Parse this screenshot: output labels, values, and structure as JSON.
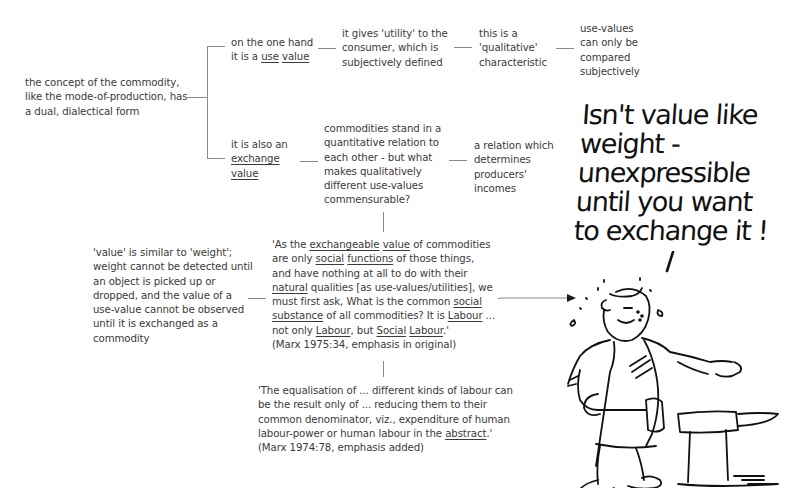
{
  "diagram": {
    "root": {
      "text": "the concept of the commodity, like the mode-of-production, has a dual, dialectical form"
    },
    "use_value_branch": {
      "label_prefix": "on the one hand it is a ",
      "label_u1": "use",
      "label_u2": "value",
      "utility": "it gives 'utility' to the consumer, which is subjectively defined",
      "qualitative": "this is a 'qualitative' characteristic",
      "compared": "use-values can only be compared subjectively"
    },
    "exchange_value_branch": {
      "label_prefix": "it is also an",
      "label_u1": "exchange",
      "label_u2": "value",
      "quantitative": "commodities stand in a quantitative relation to each other - but what makes qualitatively different use-values commensurable?",
      "incomes": "a relation which determines producers' incomes"
    },
    "weight_note": "'value' is similar to 'weight'; weight cannot be detected until an object is picked up or dropped, and the value of a use-value cannot be observed until it is exchanged as a commodity",
    "quote1": {
      "parts": [
        {
          "t": "'As the ",
          "s": ""
        },
        {
          "t": "exchangeable",
          "s": "u"
        },
        {
          "t": " ",
          "s": ""
        },
        {
          "t": "value",
          "s": "u"
        },
        {
          "t": " of commodities are only ",
          "s": ""
        },
        {
          "t": "social",
          "s": "u"
        },
        {
          "t": " ",
          "s": ""
        },
        {
          "t": "functions",
          "s": "u"
        },
        {
          "t": " of those things, and have nothing at all to do with their ",
          "s": ""
        },
        {
          "t": "natural",
          "s": "u"
        },
        {
          "t": " qualities [as use-values/utilities], we must first ask, What is the common ",
          "s": ""
        },
        {
          "t": "social",
          "s": "u"
        },
        {
          "t": " ",
          "s": ""
        },
        {
          "t": "substance",
          "s": "u"
        },
        {
          "t": " of all commodities? It is ",
          "s": ""
        },
        {
          "t": "Labour",
          "s": "u"
        },
        {
          "t": " ... not only ",
          "s": ""
        },
        {
          "t": "Labour",
          "s": "u"
        },
        {
          "t": ", but ",
          "s": ""
        },
        {
          "t": "Social",
          "s": "u"
        },
        {
          "t": " ",
          "s": ""
        },
        {
          "t": "Labour",
          "s": "u"
        },
        {
          "t": ".'",
          "s": ""
        }
      ],
      "citation": "(Marx 1975:34, emphasis in original)"
    },
    "quote2": {
      "text_before": "'The equalisation of ... different kinds of labour can be the result only of ... reducing them to their common denominator, viz., expenditure of human labour-power or human labour in the ",
      "underlined": "abstract",
      "text_after": ".'",
      "citation": "(Marx 1974:78, emphasis added)"
    }
  },
  "cartoon": {
    "speech_lines": [
      "Isn't value like",
      "weight -",
      "unexpressible",
      "until you want",
      "to exchange it !"
    ],
    "figure": "blacksmith-with-hammer-at-anvil"
  }
}
